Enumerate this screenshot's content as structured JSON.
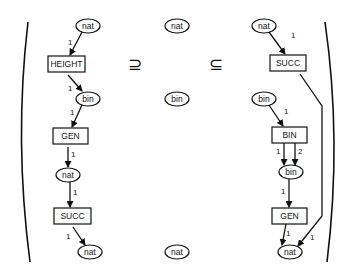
{
  "diagram": {
    "type": "petri-net-refinement",
    "relations": {
      "left": "⊇",
      "right": "⊆"
    },
    "columns": [
      {
        "name": "left",
        "places": [
          {
            "id": "l-nat-top",
            "label": "nat",
            "x": 88,
            "y": 26
          },
          {
            "id": "l-bin",
            "label": "bin",
            "x": 88,
            "y": 99
          },
          {
            "id": "l-nat-mid",
            "label": "nat",
            "x": 68,
            "y": 175
          },
          {
            "id": "l-nat-bot",
            "label": "nat",
            "x": 90,
            "y": 252
          }
        ],
        "transitions": [
          {
            "id": "l-height",
            "label": "HEIGHT",
            "x": 48,
            "y": 56,
            "w": 37,
            "h": 16
          },
          {
            "id": "l-gen",
            "label": "GEN",
            "x": 53,
            "y": 128,
            "w": 35,
            "h": 16
          },
          {
            "id": "l-succ",
            "label": "SUCC",
            "x": 54,
            "y": 208,
            "w": 37,
            "h": 16
          }
        ],
        "arc_labels": [
          "1",
          "1",
          "1",
          "1",
          "1",
          "1"
        ]
      },
      {
        "name": "middle",
        "places": [
          {
            "id": "m-nat-top",
            "label": "nat",
            "x": 177,
            "y": 26
          },
          {
            "id": "m-bin",
            "label": "bin",
            "x": 177,
            "y": 99
          },
          {
            "id": "m-nat-bot",
            "label": "nat",
            "x": 177,
            "y": 252
          }
        ]
      },
      {
        "name": "right",
        "places": [
          {
            "id": "r-nat-top",
            "label": "nat",
            "x": 264,
            "y": 26
          },
          {
            "id": "r-bin-top",
            "label": "bin",
            "x": 264,
            "y": 99
          },
          {
            "id": "r-bin-mid",
            "label": "bin",
            "x": 291,
            "y": 172
          },
          {
            "id": "r-nat-bot",
            "label": "nat",
            "x": 290,
            "y": 252
          }
        ],
        "transitions": [
          {
            "id": "r-succ",
            "label": "SUCC",
            "x": 270,
            "y": 55,
            "w": 36,
            "h": 16
          },
          {
            "id": "r-bin-t",
            "label": "BIN",
            "x": 272,
            "y": 127,
            "w": 35,
            "h": 16
          },
          {
            "id": "r-gen",
            "label": "GEN",
            "x": 272,
            "y": 208,
            "w": 35,
            "h": 16
          }
        ],
        "arc_labels": [
          "1",
          "1",
          "1",
          "2",
          "1",
          "1",
          "1"
        ]
      }
    ]
  },
  "text": {
    "nat": "nat",
    "bin": "bin",
    "height": "HEIGHT",
    "gen": "GEN",
    "succ": "SUCC",
    "bin_t": "BIN",
    "one": "1",
    "two": "2",
    "supseteq": "⊇",
    "subseteq": "⊆"
  }
}
